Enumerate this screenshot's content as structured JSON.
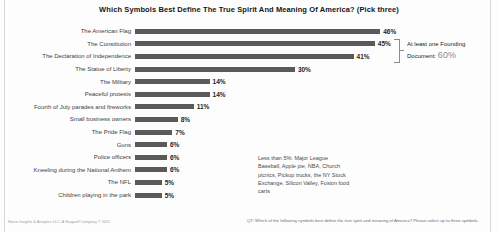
{
  "title": "Which Symbols Best Define The True Spirit And Meaning Of America? (Pick three)",
  "chart_data": {
    "type": "bar",
    "orientation": "horizontal",
    "title": "Which Symbols Best Define The True Spirit And Meaning Of America? (Pick three)",
    "categories": [
      "The American Flag",
      "The Constitution",
      "The Declaration of Independence",
      "The Statue of Liberty",
      "The Military",
      "Peaceful protests",
      "Fourth of July parades and fireworks",
      "Small business owners",
      "The Pride Flag",
      "Guns",
      "Police officers",
      "Kneeling during the National Anthem",
      "The NFL",
      "Children playing in the park"
    ],
    "values": [
      46,
      45,
      41,
      30,
      14,
      14,
      11,
      8,
      7,
      6,
      6,
      6,
      5,
      5
    ],
    "value_suffix": "%",
    "xlim": [
      0,
      50
    ],
    "grid": false,
    "legend": false,
    "bar_color": "#5a5a5a",
    "annotations": [
      {
        "target_categories": [
          "The Constitution",
          "The Declaration of Independence"
        ],
        "text": "At least one Founding Document: 60%"
      },
      {
        "text": "Less than 5%: Major League Baseball, Apple pie, NBA, Church picnics, Pickup trucks, the NY Stock Exchange, Silicon Valley, Fusion food carts"
      }
    ]
  },
  "founding_annotation": {
    "line1": "At least one Founding",
    "line2_prefix": "Document: ",
    "value": "60%"
  },
  "lessthan_annotation": "Less than 5%: Major League Baseball, Apple pie, NBA, Church picnics, Pickup trucks, the NY Stock Exchange, Silicon Valley, Fusion food carts",
  "footer": {
    "source": "Harris Insights & Analytics LLC, A Stagwell Company © 2021",
    "question": "Q7: Which of the following symbols best define the true spirit and meaning of America? Please select up to three symbols."
  }
}
